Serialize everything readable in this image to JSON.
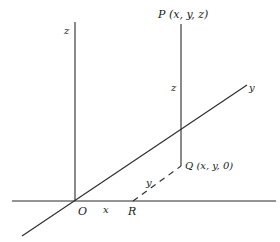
{
  "diagram": {
    "type": "3d-coordinate-axes",
    "labels": {
      "z_axis": "z",
      "y_axis": "y",
      "origin": "O",
      "x_segment": "x",
      "y_segment": "y",
      "z_segment": "z",
      "point_P": "P (x, y, z)",
      "point_Q": "Q (x, y, 0)",
      "point_R": "R"
    },
    "points": {
      "O": [
        75,
        201
      ],
      "P": [
        181,
        24
      ],
      "Q": [
        181,
        166
      ],
      "R": [
        133,
        201
      ]
    },
    "colors": {
      "line": "#2a2a2a",
      "background": "#ffffff"
    }
  }
}
